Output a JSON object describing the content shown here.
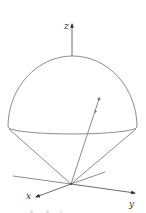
{
  "diagram": {
    "axes": {
      "z_label": "z",
      "x_label": "x",
      "y_label": "y"
    },
    "colors": {
      "line": "#6e6e6e",
      "axis": "#444444",
      "label": "#333333",
      "background": "#ffffff"
    },
    "caption_fragment": ""
  }
}
